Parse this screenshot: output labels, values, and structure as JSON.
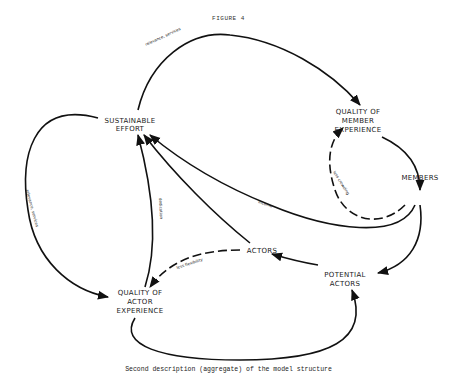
{
  "figure": {
    "title": "FIGURE 4",
    "caption": "Second description (aggregate) of the model structure"
  },
  "nodes": {
    "sustainable_effort": [
      "SUSTAINABLE",
      "EFFORT"
    ],
    "quality_member_experience": [
      "QUALITY OF",
      "MEMBER",
      "EXPERIENCE"
    ],
    "members": [
      "MEMBERS"
    ],
    "actors": [
      "ACTORS"
    ],
    "potential_actors": [
      "POTENTIAL",
      "ACTORS"
    ],
    "quality_actor_experience": [
      "QUALITY OF",
      "ACTOR",
      "EXPERIENCE"
    ]
  },
  "edges": {
    "top_label": "relevance, services",
    "left_label": "relevance, services",
    "crowding_label": "less crowding",
    "income_label": "income",
    "dedication_label": "dedication",
    "flexibility_label": "less flexibility"
  }
}
